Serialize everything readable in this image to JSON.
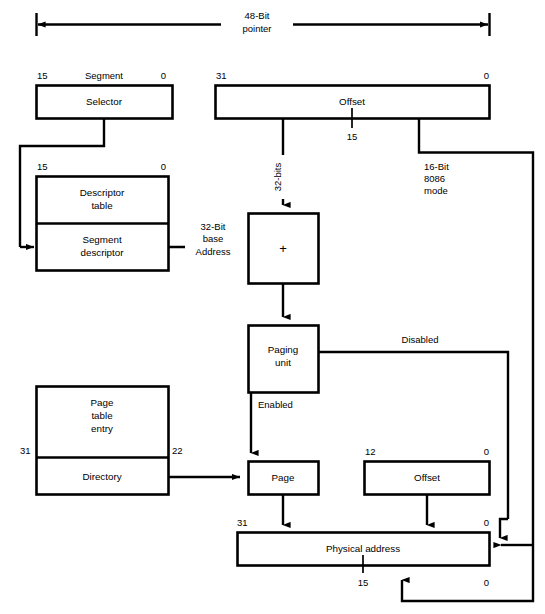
{
  "diagram": {
    "top_arrow": {
      "label_line1": "48-Bit",
      "label_line2": "pointer"
    },
    "segment_group": {
      "header": "Segment",
      "msb": "15",
      "lsb": "0",
      "box_label": "Selector"
    },
    "offset_top": {
      "msb": "31",
      "lsb": "0",
      "box_label": "Offset",
      "mid_tick_label": "15"
    },
    "descriptor_group": {
      "msb": "15",
      "lsb": "0",
      "upper_label_line1": "Descriptor",
      "upper_label_line2": "table",
      "lower_label_line1": "Segment",
      "lower_label_line2": "descriptor"
    },
    "base_address_label": {
      "line1": "32-Bit",
      "line2": "base",
      "line3": "Address"
    },
    "bits32_label": "32-bits",
    "mode16_label": {
      "line1": "16-Bit",
      "line2": "8086",
      "line3": "mode"
    },
    "adder": {
      "symbol": "+"
    },
    "paging_unit": {
      "label_line1": "Paging",
      "label_line2": "unit",
      "disabled_label": "Disabled",
      "enabled_label": "Enabled"
    },
    "page_table_entry": {
      "upper_label_line1": "Page",
      "upper_label_line2": "table",
      "upper_label_line3": "entry",
      "lower_label": "Directory",
      "msb": "31",
      "lsb": "22"
    },
    "page_box": {
      "label": "Page"
    },
    "offset_bottom": {
      "msb": "12",
      "lsb": "0",
      "box_label": "Offset"
    },
    "physical_address": {
      "label": "Physical address",
      "msb": "31",
      "lsb_top": "0",
      "lsb_bottom": "0",
      "mid_tick_label": "15"
    },
    "colors": {
      "line": "#000000",
      "fill": "#ffffff",
      "text": "#000000"
    }
  }
}
